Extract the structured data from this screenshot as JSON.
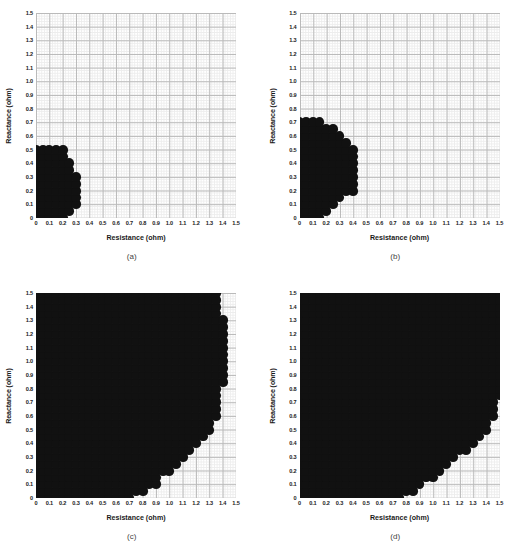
{
  "figure": {
    "layout": "2x2",
    "panels": [
      {
        "caption": "(a)",
        "key": "a"
      },
      {
        "caption": "(b)",
        "key": "b"
      },
      {
        "caption": "(c)",
        "key": "c"
      },
      {
        "caption": "(d)",
        "key": "d"
      }
    ]
  },
  "axis": {
    "xlabel": "Resistance (ohm)",
    "ylabel": "Reactance (ohm)",
    "ticks": [
      "0",
      "0.1",
      "0.2",
      "0.3",
      "0.4",
      "0.5",
      "0.6",
      "0.7",
      "0.8",
      "0.9",
      "1.0",
      "1.1",
      "1.2",
      "1.3",
      "1.4",
      "1.5"
    ],
    "xlim": [
      0,
      1.5
    ],
    "ylim": [
      0,
      1.5
    ],
    "tick_step": 0.1,
    "minor_step": 0.02,
    "grid": true,
    "grid_major_color": "#b9b9b9",
    "grid_minor_color": "#ededed"
  },
  "style": {
    "marker_color": "#111111",
    "marker_shape": "circle",
    "background": "#ffffff",
    "point_spacing": 0.05
  },
  "chart_data": [
    {
      "type": "scatter",
      "name": "(a)",
      "title": "(a)",
      "xlabel": "Resistance (ohm)",
      "ylabel": "Reactance (ohm)",
      "xlim": [
        0,
        1.5
      ],
      "ylim": [
        0,
        1.5
      ],
      "grid": true,
      "marker": "filled-circle",
      "color": "#111111",
      "spacing": 0.05,
      "description": "Feasible impedance region: quarter-disc of radius approx 0.36 ohm centred at origin",
      "boundary_type": "quarter-circle",
      "radius": 0.36,
      "row_max_x": {
        "0.00": 0.2,
        "0.05": 0.25,
        "0.10": 0.3,
        "0.15": 0.3,
        "0.20": 0.3,
        "0.25": 0.3,
        "0.30": 0.3,
        "0.35": 0.25,
        "0.40": 0.25,
        "0.45": 0.2,
        "0.50": 0.2
      },
      "n_points": 68
    },
    {
      "type": "scatter",
      "name": "(b)",
      "title": "(b)",
      "xlabel": "Resistance (ohm)",
      "ylabel": "Reactance (ohm)",
      "xlim": [
        0,
        1.5
      ],
      "ylim": [
        0,
        1.5
      ],
      "grid": true,
      "marker": "filled-circle",
      "color": "#111111",
      "spacing": 0.05,
      "description": "Feasible impedance region: quarter-disc of radius approx 0.42 ohm; extends to 0.70 ohm reactance and 0.40 ohm resistance",
      "boundary_type": "quarter-circle",
      "radius": 0.42,
      "row_max_x": {
        "0.00": 0.15,
        "0.05": 0.2,
        "0.10": 0.25,
        "0.15": 0.3,
        "0.20": 0.4,
        "0.25": 0.4,
        "0.30": 0.4,
        "0.35": 0.4,
        "0.40": 0.4,
        "0.45": 0.4,
        "0.50": 0.4,
        "0.55": 0.35,
        "0.60": 0.3,
        "0.65": 0.25,
        "0.70": 0.15
      },
      "n_points": 122
    },
    {
      "type": "scatter",
      "name": "(c)",
      "title": "(c)",
      "xlabel": "Resistance (ohm)",
      "ylabel": "Reactance (ohm)",
      "xlim": [
        0,
        1.5
      ],
      "ylim": [
        0,
        1.5
      ],
      "grid": true,
      "marker": "filled-circle",
      "color": "#111111",
      "spacing": 0.05,
      "description": "Large feasible region covering most of the plane; lower-right corner cut off by a diagonal boundary running from about (0.70, 0) to (1.40, 1.50)",
      "boundary_type": "diagonal-cut",
      "cut_from": [
        0.7,
        0.0
      ],
      "cut_to": [
        1.4,
        1.5
      ],
      "row_max_x": {
        "0.00": 0.7,
        "0.05": 0.8,
        "0.10": 0.9,
        "0.15": 0.9,
        "0.20": 1.0,
        "0.25": 1.05,
        "0.30": 1.1,
        "0.35": 1.15,
        "0.40": 1.2,
        "0.45": 1.25,
        "0.50": 1.3,
        "0.55": 1.3,
        "0.60": 1.35,
        "0.65": 1.35,
        "0.70": 1.35,
        "0.75": 1.35,
        "0.80": 1.35,
        "0.85": 1.4,
        "0.90": 1.4,
        "0.95": 1.4,
        "1.00": 1.4,
        "1.05": 1.4,
        "1.10": 1.4,
        "1.15": 1.4,
        "1.20": 1.4,
        "1.25": 1.4,
        "1.30": 1.4,
        "1.35": 1.35,
        "1.40": 1.35,
        "1.45": 1.35,
        "1.50": 1.35
      },
      "n_points": 744
    },
    {
      "type": "scatter",
      "name": "(d)",
      "title": "(d)",
      "xlabel": "Resistance (ohm)",
      "ylabel": "Reactance (ohm)",
      "xlim": [
        0,
        1.5
      ],
      "ylim": [
        0,
        1.5
      ],
      "grid": true,
      "marker": "filled-circle",
      "color": "#111111",
      "spacing": 0.05,
      "description": "Largest feasible region; fills the plane up to the right edge above 0.75 ohm reactance, with a diagonal cut from about (0.75, 0) to (1.50, 0.75)",
      "boundary_type": "diagonal-cut",
      "cut_from": [
        0.75,
        0.0
      ],
      "cut_to": [
        1.5,
        0.8
      ],
      "row_max_x": {
        "0.00": 0.75,
        "0.05": 0.85,
        "0.10": 0.9,
        "0.15": 1.0,
        "0.20": 1.05,
        "0.25": 1.1,
        "0.30": 1.15,
        "0.35": 1.25,
        "0.40": 1.3,
        "0.45": 1.35,
        "0.50": 1.4,
        "0.55": 1.4,
        "0.60": 1.45,
        "0.65": 1.45,
        "0.70": 1.45,
        "0.75": 1.5,
        "0.80": 1.5,
        "0.85": 1.5,
        "0.90": 1.5,
        "0.95": 1.5,
        "1.00": 1.5,
        "1.05": 1.5,
        "1.10": 1.5,
        "1.15": 1.5,
        "1.20": 1.5,
        "1.25": 1.5,
        "1.30": 1.5,
        "1.35": 1.5,
        "1.40": 1.5,
        "1.45": 1.5,
        "1.50": 1.5
      },
      "n_points": 850
    }
  ]
}
